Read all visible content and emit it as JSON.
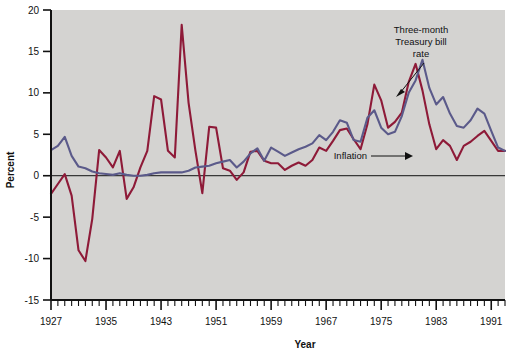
{
  "chart_data": {
    "type": "line",
    "title": "",
    "xlabel": "Year",
    "ylabel": "Percent",
    "xlim": [
      1927,
      1993
    ],
    "ylim": [
      -15,
      20
    ],
    "yticks": [
      -15,
      -10,
      -5,
      0,
      5,
      10,
      15,
      20
    ],
    "xticks": [
      1927,
      1935,
      1943,
      1951,
      1959,
      1967,
      1975,
      1983,
      1991
    ],
    "xtick_labels": [
      "1927",
      "1935",
      "1943",
      "1951",
      "1959",
      "1967",
      "1975",
      "1983",
      "1991"
    ],
    "ytick_labels": [
      "-15",
      "-10",
      "-5",
      "0",
      "5",
      "10",
      "15",
      "20"
    ],
    "grid": false,
    "legend": "annotations",
    "zero_line": 0,
    "minor_tick_interval": 1,
    "x": [
      1927,
      1928,
      1929,
      1930,
      1931,
      1932,
      1933,
      1934,
      1935,
      1936,
      1937,
      1938,
      1939,
      1940,
      1941,
      1942,
      1943,
      1944,
      1945,
      1946,
      1947,
      1948,
      1949,
      1950,
      1951,
      1952,
      1953,
      1954,
      1955,
      1956,
      1957,
      1958,
      1959,
      1960,
      1961,
      1962,
      1963,
      1964,
      1965,
      1966,
      1967,
      1968,
      1969,
      1970,
      1971,
      1972,
      1973,
      1974,
      1975,
      1976,
      1977,
      1978,
      1979,
      1980,
      1981,
      1982,
      1983,
      1984,
      1985,
      1986,
      1987,
      1988,
      1989,
      1990,
      1991,
      1992,
      1993
    ],
    "series": [
      {
        "name": "Inflation",
        "color": "#8e1a38",
        "annotation": "Inflation",
        "values": [
          -2.2,
          -1.0,
          0.2,
          -2.4,
          -9.0,
          -10.3,
          -5.2,
          3.1,
          2.2,
          1.0,
          3.0,
          -2.8,
          -1.4,
          1.0,
          3.0,
          9.6,
          9.2,
          3.0,
          2.2,
          18.2,
          8.8,
          3.0,
          -2.1,
          5.9,
          5.8,
          0.9,
          0.6,
          -0.5,
          0.4,
          2.9,
          3.0,
          1.8,
          1.5,
          1.5,
          0.7,
          1.2,
          1.6,
          1.2,
          1.9,
          3.4,
          3.0,
          4.2,
          5.5,
          5.7,
          4.4,
          3.2,
          6.2,
          11.0,
          9.1,
          5.8,
          6.5,
          7.6,
          11.3,
          13.5,
          10.3,
          6.2,
          3.2,
          4.3,
          3.6,
          1.9,
          3.6,
          4.1,
          4.8,
          5.4,
          4.2,
          3.0,
          3.0
        ]
      },
      {
        "name": "Three-month Treasury bill rate",
        "color": "#5b5a8a",
        "annotation": "Three-month Treasury bill rate",
        "values": [
          3.1,
          3.6,
          4.7,
          2.4,
          1.1,
          0.9,
          0.5,
          0.3,
          0.2,
          0.1,
          0.3,
          0.1,
          0.0,
          0.0,
          0.1,
          0.3,
          0.4,
          0.4,
          0.4,
          0.4,
          0.6,
          1.0,
          1.1,
          1.2,
          1.5,
          1.7,
          1.9,
          1.0,
          1.7,
          2.7,
          3.3,
          1.8,
          3.4,
          2.9,
          2.4,
          2.8,
          3.2,
          3.5,
          3.9,
          4.9,
          4.3,
          5.3,
          6.7,
          6.4,
          4.3,
          4.1,
          7.0,
          7.9,
          5.8,
          5.0,
          5.3,
          7.2,
          10.0,
          11.5,
          14.0,
          10.6,
          8.6,
          9.5,
          7.5,
          6.0,
          5.8,
          6.7,
          8.1,
          7.5,
          5.4,
          3.4,
          3.0
        ]
      }
    ],
    "annotations": [
      {
        "name": "tbill-annotation",
        "lines": [
          "Three-month",
          "Treasury bill",
          "rate"
        ],
        "arrow": "points down-left to blue line"
      },
      {
        "name": "inflation-annotation",
        "lines": [
          "Inflation"
        ],
        "arrow": "points right to red line"
      }
    ]
  },
  "style": {
    "plot_background": "#d4d3d1",
    "page_background": "#ffffff",
    "axis_color": "#111111",
    "inflation_color": "#8e1a38",
    "tbill_color": "#5b5a8a"
  }
}
